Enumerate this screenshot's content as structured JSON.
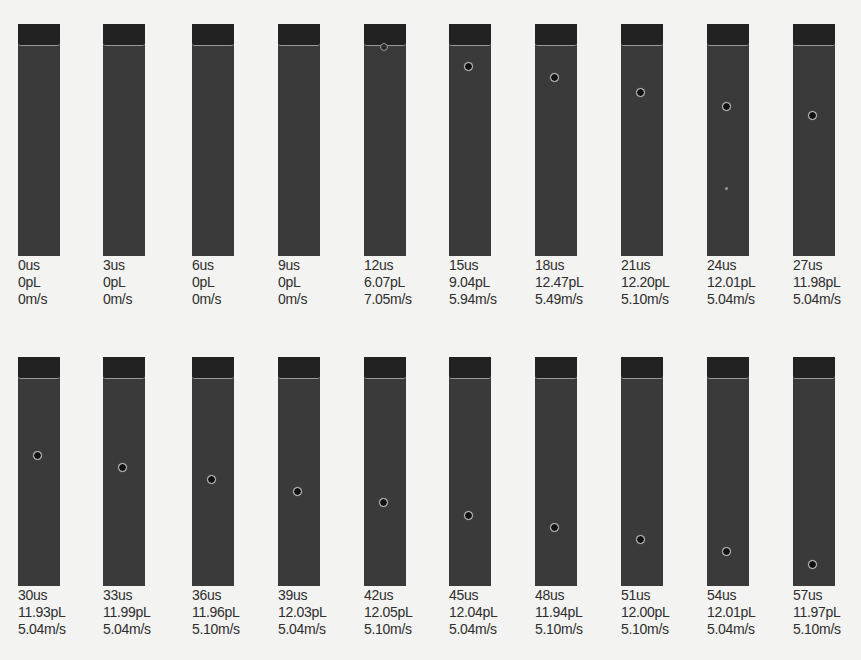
{
  "figure": {
    "rows": [
      {
        "frames": [
          {
            "time": "0us",
            "volume": "0pL",
            "velocity": "0m/s",
            "droplet": null,
            "satellite": null,
            "meniscus": false
          },
          {
            "time": "3us",
            "volume": "0pL",
            "velocity": "0m/s",
            "droplet": null,
            "satellite": null,
            "meniscus": false
          },
          {
            "time": "6us",
            "volume": "0pL",
            "velocity": "0m/s",
            "droplet": null,
            "satellite": null,
            "meniscus": false
          },
          {
            "time": "9us",
            "volume": "0pL",
            "velocity": "0m/s",
            "droplet": null,
            "satellite": null,
            "meniscus": false
          },
          {
            "time": "12us",
            "volume": "6.07pL",
            "velocity": "7.05m/s",
            "droplet": null,
            "satellite": null,
            "meniscus": true
          },
          {
            "time": "15us",
            "volume": "9.04pL",
            "velocity": "5.94m/s",
            "droplet": 43,
            "satellite": null,
            "meniscus": false
          },
          {
            "time": "18us",
            "volume": "12.47pL",
            "velocity": "5.49m/s",
            "droplet": 54,
            "satellite": null,
            "meniscus": false
          },
          {
            "time": "21us",
            "volume": "12.20pL",
            "velocity": "5.10m/s",
            "droplet": 69,
            "satellite": null,
            "meniscus": false
          },
          {
            "time": "24us",
            "volume": "12.01pL",
            "velocity": "5.04m/s",
            "droplet": 83,
            "satellite": 163,
            "meniscus": false
          },
          {
            "time": "27us",
            "volume": "11.98pL",
            "velocity": "5.04m/s",
            "droplet": 92,
            "satellite": null,
            "meniscus": false
          }
        ]
      },
      {
        "frames": [
          {
            "time": "30us",
            "volume": "11.93pL",
            "velocity": "5.04m/s",
            "droplet": 99,
            "satellite": null,
            "meniscus": false
          },
          {
            "time": "33us",
            "volume": "11.99pL",
            "velocity": "5.04m/s",
            "droplet": 111,
            "satellite": null,
            "meniscus": false
          },
          {
            "time": "36us",
            "volume": "11.96pL",
            "velocity": "5.10m/s",
            "droplet": 123,
            "satellite": null,
            "meniscus": false
          },
          {
            "time": "39us",
            "volume": "12.03pL",
            "velocity": "5.04m/s",
            "droplet": 135,
            "satellite": null,
            "meniscus": false
          },
          {
            "time": "42us",
            "volume": "12.05pL",
            "velocity": "5.10m/s",
            "droplet": 146,
            "satellite": null,
            "meniscus": false
          },
          {
            "time": "45us",
            "volume": "12.04pL",
            "velocity": "5.04m/s",
            "droplet": 159,
            "satellite": null,
            "meniscus": false
          },
          {
            "time": "48us",
            "volume": "11.94pL",
            "velocity": "5.10m/s",
            "droplet": 171,
            "satellite": null,
            "meniscus": false
          },
          {
            "time": "51us",
            "volume": "12.00pL",
            "velocity": "5.10m/s",
            "droplet": 183,
            "satellite": null,
            "meniscus": false
          },
          {
            "time": "54us",
            "volume": "12.01pL",
            "velocity": "5.04m/s",
            "droplet": 195,
            "satellite": null,
            "meniscus": false
          },
          {
            "time": "57us",
            "volume": "11.97pL",
            "velocity": "5.10m/s",
            "droplet": 208,
            "satellite": null,
            "meniscus": false
          }
        ]
      }
    ]
  },
  "layout": {
    "column_x": [
      18,
      103,
      192,
      278,
      364,
      449,
      535,
      621,
      707,
      793
    ],
    "row_top": [
      24,
      357
    ],
    "panel_height": [
      232,
      229
    ],
    "label_offset_y": [
      233,
      230
    ]
  },
  "colors": {
    "page_background": "#f3f3f1",
    "panel": "#3a3a3a",
    "nozzle": "#222222",
    "label_text": "#2e2e2e"
  }
}
